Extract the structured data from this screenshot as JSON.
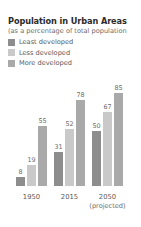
{
  "chart_data": {
    "type": "bar",
    "title": "Population in Urban Areas",
    "subtitle": "(as a percentage of total population",
    "xlabel": "",
    "ylabel": "",
    "ylim": [
      0,
      100
    ],
    "grid": false,
    "legend_position": "top-left",
    "categories": [
      "1950",
      "2015",
      "2050"
    ],
    "category_annotations": [
      "",
      "",
      "(projected)"
    ],
    "series": [
      {
        "name": "Least developed",
        "color": "#8d8d8d",
        "values": [
          8,
          31,
          50
        ]
      },
      {
        "name": "Less developed",
        "color": "#c9c9c9",
        "values": [
          19,
          52,
          67
        ]
      },
      {
        "name": "More developed",
        "color": "#a9a9a9",
        "values": [
          55,
          78,
          85
        ]
      }
    ]
  },
  "legend": {
    "items": [
      {
        "label": "Least developed",
        "swatch_color": "#8d8d8d"
      },
      {
        "label": "Less developed",
        "swatch_color": "#c9c9c9"
      },
      {
        "label": "More developed",
        "swatch_color": "#a9a9a9"
      }
    ]
  },
  "axis": {
    "ticks": [
      {
        "label": "1950",
        "sub": ""
      },
      {
        "label": "2015",
        "sub": ""
      },
      {
        "label": "2050",
        "sub": "(projected)"
      }
    ]
  },
  "bars": {
    "g0s0": "8",
    "g0s1": "19",
    "g0s2": "55",
    "g1s0": "31",
    "g1s1": "52",
    "g1s2": "78",
    "g2s0": "50",
    "g2s1": "67",
    "g2s2": "85"
  }
}
